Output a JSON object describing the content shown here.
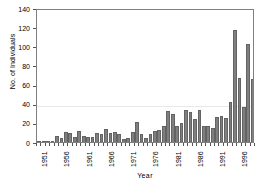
{
  "chart_data": {
    "type": "bar",
    "title": "",
    "xlabel": "Year",
    "ylabel": "No. of Individuals",
    "ylim": [
      0,
      140
    ],
    "ytick_values": [
      0,
      20,
      40,
      60,
      80,
      100,
      120,
      140
    ],
    "ytick_labels": [
      "0",
      "20",
      "40",
      "60",
      "80",
      "100",
      "120",
      "140"
    ],
    "xtick_labels": [
      "1951",
      "1956",
      "1961",
      "1966",
      "1971",
      "1976",
      "1981",
      "1986",
      "1991",
      "1996"
    ],
    "xtick_categories": [
      "1951",
      "1956",
      "1961",
      "1966",
      "1971",
      "1976",
      "1981",
      "1986",
      "1991",
      "1996"
    ],
    "grid": "horizontal-faint",
    "legend": "none",
    "bar_color": "#7f7f7f",
    "bar_edge_color": "#636363",
    "frame_color": "#808080",
    "categories": [
      "1951",
      "1952",
      "1953",
      "1954",
      "1955",
      "1956",
      "1957",
      "1958",
      "1959",
      "1960",
      "1961",
      "1962",
      "1963",
      "1964",
      "1965",
      "1966",
      "1967",
      "1968",
      "1969",
      "1970",
      "1971",
      "1972",
      "1973",
      "1974",
      "1975",
      "1976",
      "1977",
      "1978",
      "1979",
      "1980",
      "1981",
      "1982",
      "1983",
      "1984",
      "1985",
      "1986",
      "1987",
      "1988",
      "1989",
      "1990",
      "1991",
      "1992",
      "1993",
      "1994",
      "1995",
      "1996",
      "1997",
      "1998",
      "1999"
    ],
    "values": [
      0,
      1,
      0,
      0,
      6,
      4,
      10,
      9,
      5,
      11,
      6,
      5,
      5,
      9,
      8,
      14,
      9,
      10,
      8,
      3,
      4,
      10,
      21,
      8,
      4,
      8,
      11,
      13,
      17,
      32,
      29,
      17,
      20,
      33,
      31,
      24,
      33,
      17,
      17,
      15,
      26,
      27,
      25,
      42,
      117,
      67,
      37,
      102,
      66
    ]
  }
}
